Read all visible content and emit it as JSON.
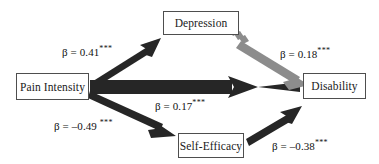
{
  "figure": {
    "type": "path-diagram",
    "background_color": "#ffffff"
  },
  "nodes": [
    {
      "id": "depression",
      "label": "Depression"
    },
    {
      "id": "pain_intensity",
      "label": "Pain Intensity"
    },
    {
      "id": "disability",
      "label": "Disability"
    },
    {
      "id": "self_efficacy",
      "label": "Self-Efficacy"
    }
  ],
  "edges": [
    {
      "id": "pain_to_depression",
      "from": "Pain Intensity",
      "to": "Depression",
      "coefficient": "β = 0.41",
      "significance": "***",
      "color": "#262626",
      "style": "solid-thick"
    },
    {
      "id": "depression_to_disability",
      "from": "Depression",
      "to": "Disability",
      "coefficient": "β = 0.18",
      "significance": "***",
      "color": "#8c8c8c",
      "style": "solid-thick-gray-hatched-tail"
    },
    {
      "id": "pain_to_disability",
      "from": "Pain Intensity",
      "to": "Disability",
      "coefficient": "β = 0.17",
      "significance": "***",
      "color": "#262626",
      "style": "solid-thick"
    },
    {
      "id": "pain_to_self_efficacy",
      "from": "Pain Intensity",
      "to": "Self-Efficacy",
      "coefficient": "β = –0.49",
      "significance": "***",
      "color": "#262626",
      "style": "solid-thick"
    },
    {
      "id": "self_efficacy_to_disability",
      "from": "Self-Efficacy",
      "to": "Disability",
      "coefficient": "β = –0.38",
      "significance": "***",
      "color": "#262626",
      "style": "solid-thick"
    }
  ],
  "colors": {
    "arrow_black": "#262626",
    "arrow_gray": "#8c8c8c",
    "box_border": "#4e4e4e",
    "text": "#111111"
  }
}
